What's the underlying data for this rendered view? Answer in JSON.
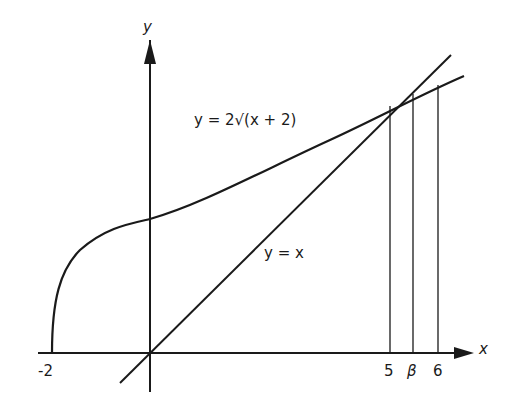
{
  "figure": {
    "axes": {
      "x_label": "x",
      "y_label": "y"
    },
    "curves": [
      {
        "name": "sqrt-curve",
        "equation": "y = 2√(x + 2)"
      },
      {
        "name": "identity-line",
        "equation": "y = x"
      }
    ],
    "x_ticks": [
      {
        "label": "-2",
        "value": -2
      },
      {
        "label": "5",
        "value": 5
      },
      {
        "label": "β",
        "value": 5.46
      },
      {
        "label": "6",
        "value": 6
      }
    ],
    "colors": {
      "ink": "#1a1a1a",
      "background": "#ffffff"
    }
  }
}
